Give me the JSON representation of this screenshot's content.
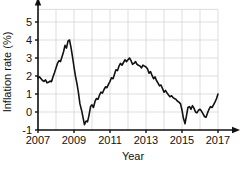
{
  "chart_data": {
    "type": "line",
    "title": "",
    "subtitle": "",
    "xlabel": "Year",
    "ylabel": "Inflation rate (%)",
    "xlim": [
      2007,
      2017
    ],
    "ylim": [
      -1,
      5.7
    ],
    "xticks": [
      2007,
      2009,
      2011,
      2013,
      2015,
      2017
    ],
    "xtick_labels": [
      "2007",
      "2009",
      "2011",
      "2013",
      "2015",
      "2017"
    ],
    "yticks": [
      -1,
      0,
      1,
      2,
      3,
      4,
      5
    ],
    "ytick_labels": [
      "-1",
      "0",
      "1",
      "2",
      "3",
      "4",
      "5"
    ],
    "grid": true,
    "grid_x_step": 1,
    "grid_y_step": 1,
    "legend": null,
    "line_color": "#111111",
    "grid_color": "#cfcfcf",
    "axis_color": "#111111",
    "background": "#ffffff",
    "series": [
      {
        "name": "Inflation rate",
        "x": [
          2007.0,
          2007.08,
          2007.17,
          2007.25,
          2007.33,
          2007.42,
          2007.5,
          2007.58,
          2007.67,
          2007.75,
          2007.83,
          2007.92,
          2008.0,
          2008.08,
          2008.17,
          2008.25,
          2008.33,
          2008.42,
          2008.5,
          2008.58,
          2008.67,
          2008.75,
          2008.83,
          2008.92,
          2009.0,
          2009.08,
          2009.17,
          2009.25,
          2009.33,
          2009.42,
          2009.5,
          2009.58,
          2009.67,
          2009.75,
          2009.83,
          2009.92,
          2010.0,
          2010.08,
          2010.17,
          2010.25,
          2010.33,
          2010.42,
          2010.5,
          2010.58,
          2010.67,
          2010.75,
          2010.83,
          2010.92,
          2011.0,
          2011.08,
          2011.17,
          2011.25,
          2011.33,
          2011.42,
          2011.5,
          2011.58,
          2011.67,
          2011.75,
          2011.83,
          2011.92,
          2012.0,
          2012.08,
          2012.17,
          2012.25,
          2012.33,
          2012.42,
          2012.5,
          2012.58,
          2012.67,
          2012.75,
          2012.83,
          2012.92,
          2013.0,
          2013.08,
          2013.17,
          2013.25,
          2013.33,
          2013.42,
          2013.5,
          2013.58,
          2013.67,
          2013.75,
          2013.83,
          2013.92,
          2014.0,
          2014.08,
          2014.17,
          2014.25,
          2014.33,
          2014.42,
          2014.5,
          2014.58,
          2014.67,
          2014.75,
          2014.83,
          2014.92,
          2015.0,
          2015.08,
          2015.17,
          2015.25,
          2015.33,
          2015.42,
          2015.5,
          2015.58,
          2015.67,
          2015.75,
          2015.83,
          2015.92,
          2016.0,
          2016.08,
          2016.17,
          2016.25,
          2016.33,
          2016.42,
          2016.5,
          2016.58,
          2016.67,
          2016.75,
          2016.83,
          2016.92,
          2017.0
        ],
        "values": [
          1.9,
          1.95,
          1.85,
          1.75,
          1.7,
          1.78,
          1.62,
          1.65,
          1.72,
          1.68,
          1.95,
          2.2,
          2.45,
          2.7,
          2.85,
          2.8,
          3.05,
          3.35,
          3.7,
          3.55,
          3.95,
          4.0,
          3.6,
          3.05,
          2.5,
          2.0,
          1.55,
          1.05,
          0.45,
          0.1,
          -0.3,
          -0.7,
          -0.5,
          -0.55,
          -0.2,
          0.3,
          0.4,
          0.25,
          0.6,
          0.75,
          0.7,
          0.95,
          1.1,
          1.05,
          1.25,
          1.4,
          1.35,
          1.55,
          1.7,
          1.9,
          1.85,
          2.1,
          2.35,
          2.3,
          2.55,
          2.7,
          2.6,
          2.75,
          2.9,
          2.8,
          2.9,
          3.0,
          2.85,
          2.65,
          2.7,
          2.8,
          2.65,
          2.6,
          2.55,
          2.45,
          2.6,
          2.55,
          2.5,
          2.4,
          2.15,
          2.25,
          2.05,
          1.85,
          1.95,
          1.75,
          1.6,
          1.45,
          1.5,
          1.3,
          1.1,
          1.2,
          1.05,
          0.95,
          0.85,
          0.9,
          0.8,
          0.75,
          0.7,
          0.6,
          0.55,
          0.45,
          0.1,
          -0.35,
          -0.65,
          -0.2,
          0.25,
          0.3,
          0.15,
          0.35,
          0.2,
          0.0,
          -0.05,
          0.1,
          0.15,
          0.05,
          -0.1,
          -0.25,
          -0.3,
          -0.05,
          0.15,
          0.3,
          0.25,
          0.4,
          0.55,
          0.75,
          1.0
        ]
      }
    ]
  },
  "caption": {
    "text": ""
  }
}
